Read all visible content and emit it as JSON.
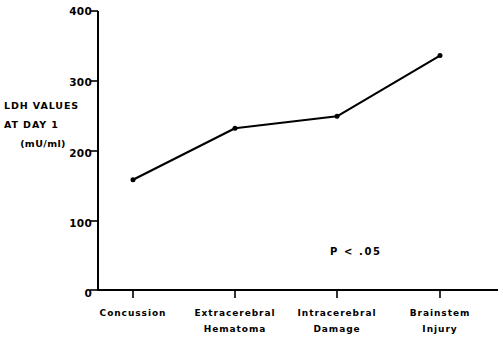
{
  "chart_data": {
    "type": "line",
    "title": "",
    "subtitle": "",
    "xlabel": "",
    "ylabel": "LDH VALUES AT DAY 1 (mU/ml)",
    "ylabel_lines": [
      "LDH VALUES",
      "AT DAY 1",
      "(mU/ml)"
    ],
    "categories": [
      "Concussion",
      "Extracerebral Hematoma",
      "Intracerebral Damage",
      "Brainstem Injury"
    ],
    "category_lines": [
      [
        "Concussion"
      ],
      [
        "Extracerebral",
        "Hematoma"
      ],
      [
        "Intracerebral",
        "Damage"
      ],
      [
        "Brainstem",
        "Injury"
      ]
    ],
    "values": [
      158,
      232,
      249,
      336
    ],
    "ylim": [
      0,
      400
    ],
    "yticks": [
      0,
      100,
      200,
      300,
      400
    ],
    "ytick_labels": [
      "0",
      "100",
      "200",
      "300",
      "400"
    ],
    "grid": false,
    "legend": null,
    "annotations": [
      {
        "text": "P < .05",
        "x_category": "Intracerebral Damage",
        "y_value": 60
      }
    ],
    "series_color": "#000000",
    "axis_color": "#000000",
    "marker": "dot",
    "background": "#ffffff"
  }
}
